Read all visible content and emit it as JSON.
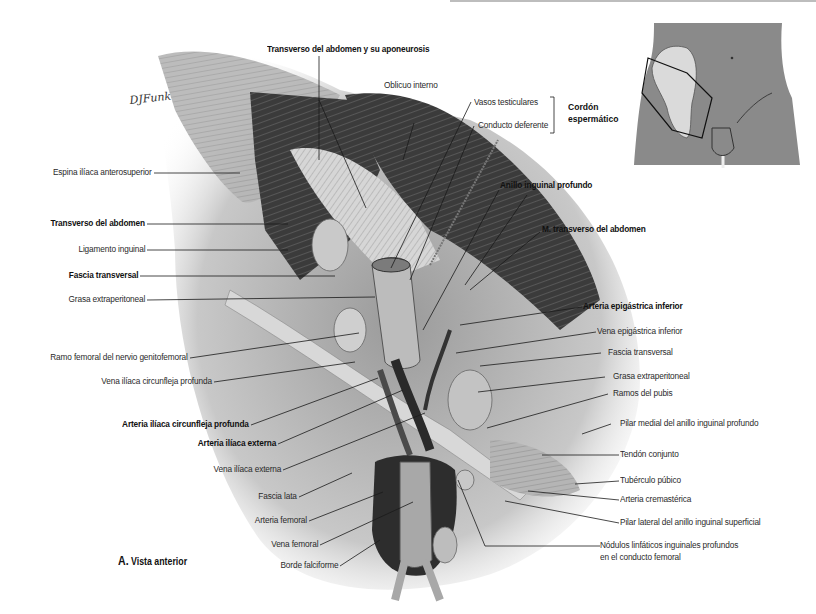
{
  "figure": {
    "caption_letter": "A.",
    "caption_text": "Vista anterior",
    "signature": "DJFunk"
  },
  "labels_top": {
    "transverso_aponeurosis": "Transverso del abdomen y su aponeurosis",
    "oblicuo_interno": "Oblicuo interno",
    "vasos_testiculares": "Vasos testiculares",
    "conducto_deferente": "Conducto deferente",
    "cordon_line1": "Cordón",
    "cordon_line2": "espermático",
    "anillo_inguinal_profundo": "Anillo inguinal profundo",
    "m_transverso": "M. transverso del abdomen"
  },
  "labels_left": [
    {
      "text": "Espina ilíaca anterosuperior",
      "bold": false
    },
    {
      "text": "Transverso del abdomen",
      "bold": true
    },
    {
      "text": "Ligamento inguinal",
      "bold": false
    },
    {
      "text": "Fascia transversal",
      "bold": true
    },
    {
      "text": "Grasa extraperitoneal",
      "bold": false
    },
    {
      "text": "Ramo femoral del nervio genitofemoral",
      "bold": false
    },
    {
      "text": "Vena ilíaca circunfleja profunda",
      "bold": false
    },
    {
      "text": "Arteria ilíaca circunfleja profunda",
      "bold": true
    },
    {
      "text": "Arteria ilíaca externa",
      "bold": true
    },
    {
      "text": "Vena ilíaca externa",
      "bold": false
    },
    {
      "text": "Fascia lata",
      "bold": false
    },
    {
      "text": "Arteria femoral",
      "bold": false
    },
    {
      "text": "Vena femoral",
      "bold": false
    },
    {
      "text": "Borde falciforme",
      "bold": false
    }
  ],
  "labels_right": [
    {
      "text": "Arteria epigástrica inferior",
      "bold": true
    },
    {
      "text": "Vena epigástrica inferior",
      "bold": false
    },
    {
      "text": "Fascia transversal",
      "bold": false
    },
    {
      "text": "Grasa extraperitoneal",
      "bold": false
    },
    {
      "text": "Ramos del pubis",
      "bold": false
    },
    {
      "text": "Pilar medial del anillo inguinal profundo",
      "bold": false
    },
    {
      "text": "Tendón conjunto",
      "bold": false
    },
    {
      "text": "Tubérculo púbico",
      "bold": false
    },
    {
      "text": "Arteria cremastérica",
      "bold": false
    },
    {
      "text": "Pilar lateral del anillo inguinal superficial",
      "bold": false
    },
    {
      "text": "Nódulos linfáticos inguinales profundos",
      "bold": false
    },
    {
      "text": "en el conducto femoral",
      "bold": false
    }
  ],
  "colors": {
    "inset_body": "#8a8a8a",
    "inset_bone": "#d9d9d9",
    "tissue_dark": "#3a3a3a",
    "tissue_mid": "#7a7a7a",
    "tissue_light": "#cfcfcf",
    "leader": "#1a1a1a"
  }
}
